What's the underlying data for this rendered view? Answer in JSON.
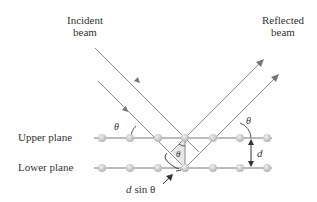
{
  "labels": {
    "incident_line1": "Incident",
    "incident_line2": "beam",
    "reflected_line1": "Reflected",
    "reflected_line2": "beam",
    "upper_plane": "Upper plane",
    "lower_plane": "Lower plane",
    "theta": "θ",
    "d": "d",
    "path_diff_d": "d",
    "path_diff_rest": "sin θ"
  },
  "colors": {
    "ray": "#8a8a8a",
    "plane": "#777777",
    "atom": "#c8c8c8",
    "text": "#333333",
    "shade": "#e6e6e6"
  }
}
